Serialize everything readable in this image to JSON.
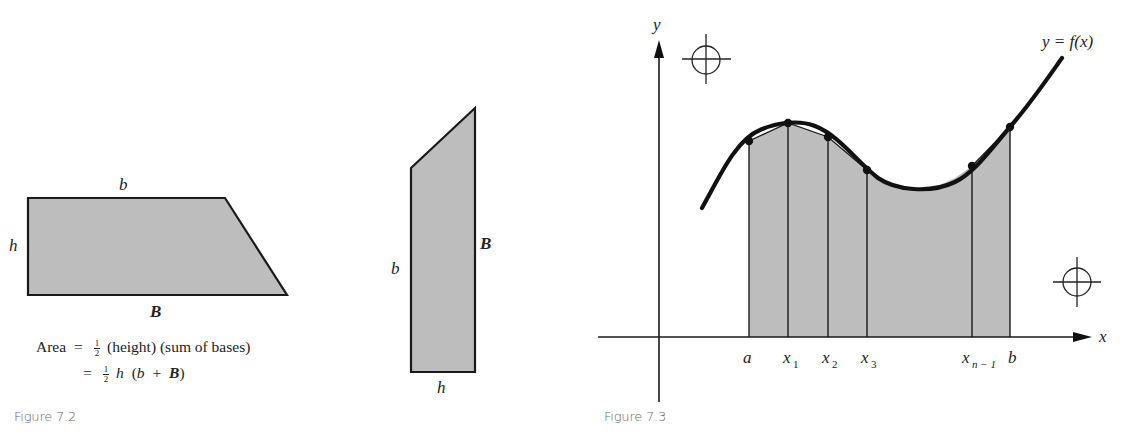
{
  "figure_7_2": {
    "caption": "Figure 7.2",
    "trapezoid_horizontal": {
      "top_label": "b",
      "bottom_label": "B",
      "side_label": "h"
    },
    "trapezoid_vertical": {
      "left_label": "b",
      "right_label": "B",
      "bottom_label": "h"
    },
    "formula": {
      "line1_lhs": "Area",
      "equals": "=",
      "half_num": "1",
      "half_den": "2",
      "line1_rhs": "(height) (sum of bases)",
      "line2_h": "h",
      "line2_open": "(",
      "line2_b": "b",
      "line2_plus": "+",
      "line2_B": "B",
      "line2_close": ")"
    }
  },
  "figure_7_3": {
    "caption": "Figure 7.3",
    "y_axis_label": "y",
    "x_axis_label": "x",
    "curve_label": "y = f(x)",
    "partition_labels": {
      "a": "a",
      "x1_base": "x",
      "x1_sub": "1",
      "x2_base": "x",
      "x2_sub": "2",
      "x3_base": "x",
      "x3_sub": "3",
      "xn1_base": "x",
      "xn1_sub": "n − 1",
      "b": "b"
    },
    "registration_marks": 2
  },
  "colors": {
    "fill_gray": "#bdbdbd",
    "stroke": "#1a1a1a",
    "caption": "#666666"
  }
}
